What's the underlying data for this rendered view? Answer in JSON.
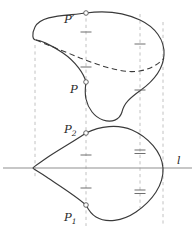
{
  "figure": {
    "background_color": "#ffffff",
    "width": 195,
    "height": 232,
    "labels": {
      "p_prime": "P",
      "p_prime_mark": "′",
      "p": "P",
      "p_two_base": "P",
      "p_two_sub": "2",
      "p_one_base": "P",
      "p_one_sub": "1",
      "line_l": "l"
    },
    "colors": {
      "curve_stroke": "#3a3a3a",
      "dashed_curve_stroke": "#3a3a3a",
      "guide_line_stroke": "#b9b9b9",
      "axis_line_stroke": "#8a8a8a",
      "tick_stroke": "#707070",
      "marker_stroke": "#555555",
      "marker_fill": "#ffffff",
      "label_fill": "#2a2a2a"
    },
    "points": [
      {
        "name": "P-prime",
        "label": "P′",
        "x": 86,
        "y": 13,
        "description": "top vertex of upper surface outline"
      },
      {
        "name": "P",
        "label": "P",
        "x": 86,
        "y": 82,
        "description": "point on lower-left boundary of upper surface"
      },
      {
        "name": "P2",
        "label": "P₂",
        "x": 86,
        "y": 133,
        "description": "upper intersection on lower closed curve"
      },
      {
        "name": "P1",
        "label": "P₁",
        "x": 86,
        "y": 205,
        "description": "lower intersection on lower closed curve"
      }
    ],
    "guides": {
      "vertical_dashed_x": [
        35,
        86,
        140,
        163
      ],
      "horizontal_axis_y": 168,
      "axis_label": "l"
    },
    "tick_marks": {
      "left_guide_upper": [
        38,
        72
      ],
      "right_guide_upper": [
        38,
        90
      ],
      "left_guide_lower": [
        155,
        188
      ],
      "right_guide_lower_double": [
        152,
        192
      ]
    }
  }
}
